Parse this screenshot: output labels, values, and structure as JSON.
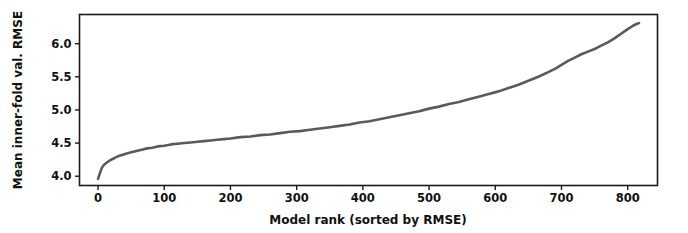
{
  "chart_data": {
    "type": "line",
    "title": "",
    "xlabel": "Model rank (sorted by RMSE)",
    "ylabel": "Mean inner-fold val. RMSE",
    "xlim": [
      -28,
      845
    ],
    "ylim": [
      3.86,
      6.44
    ],
    "xticks": [
      0,
      100,
      200,
      300,
      400,
      500,
      600,
      700,
      800
    ],
    "xtick_labels": [
      "0",
      "100",
      "200",
      "300",
      "400",
      "500",
      "600",
      "700",
      "800"
    ],
    "yticks": [
      4.0,
      4.5,
      5.0,
      5.5,
      6.0
    ],
    "ytick_labels": [
      "4.0",
      "4.5",
      "5.0",
      "5.5",
      "6.0"
    ],
    "grid": false,
    "legend": null,
    "line_color": "#5a5a5a",
    "marker": "none",
    "series": [
      {
        "name": "Mean inner-fold val. RMSE",
        "x": [
          0,
          2,
          4,
          6,
          8,
          10,
          14,
          18,
          22,
          26,
          30,
          36,
          42,
          50,
          58,
          66,
          74,
          82,
          90,
          100,
          110,
          120,
          130,
          140,
          150,
          160,
          170,
          180,
          190,
          200,
          215,
          230,
          245,
          260,
          275,
          290,
          305,
          320,
          335,
          350,
          365,
          380,
          395,
          410,
          425,
          440,
          455,
          470,
          485,
          500,
          515,
          530,
          545,
          560,
          575,
          590,
          605,
          620,
          635,
          650,
          665,
          680,
          690,
          700,
          710,
          720,
          730,
          740,
          750,
          760,
          770,
          780,
          790,
          800,
          808,
          814,
          817
        ],
        "y": [
          3.96,
          4.02,
          4.08,
          4.13,
          4.16,
          4.18,
          4.21,
          4.24,
          4.26,
          4.28,
          4.3,
          4.32,
          4.34,
          4.36,
          4.38,
          4.4,
          4.42,
          4.43,
          4.45,
          4.46,
          4.48,
          4.49,
          4.5,
          4.51,
          4.52,
          4.53,
          4.54,
          4.55,
          4.56,
          4.57,
          4.59,
          4.6,
          4.62,
          4.63,
          4.65,
          4.67,
          4.68,
          4.7,
          4.72,
          4.74,
          4.76,
          4.78,
          4.81,
          4.83,
          4.86,
          4.89,
          4.92,
          4.95,
          4.98,
          5.02,
          5.05,
          5.09,
          5.12,
          5.16,
          5.2,
          5.24,
          5.28,
          5.33,
          5.38,
          5.44,
          5.5,
          5.57,
          5.62,
          5.68,
          5.74,
          5.79,
          5.84,
          5.88,
          5.92,
          5.97,
          6.02,
          6.08,
          6.15,
          6.22,
          6.27,
          6.3,
          6.31
        ]
      }
    ]
  },
  "axes": {
    "xlabel": "Model rank (sorted by RMSE)",
    "ylabel": "Mean inner-fold val. RMSE"
  }
}
